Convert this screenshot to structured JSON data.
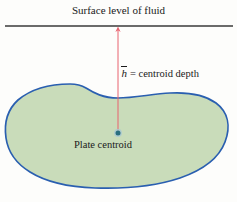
{
  "figure": {
    "name": "hydrostatic-plate-centroid-diagram",
    "background_color": "#fdfdfb",
    "surface_label": "Surface level of fluid",
    "depth_symbol": "h",
    "depth_equation": "= centroid depth",
    "centroid_label": "Plate centroid"
  },
  "colors": {
    "surface_line": "#3a3a3a",
    "arrow": "#e8626e",
    "plate_outline": "#2a5fb0",
    "plate_fill": "#c9dcba",
    "centroid_dot": "#2a6f7f",
    "text": "#1a1a1a"
  },
  "geometry": {
    "surface_line_y": 26,
    "surface_line_x1": 5,
    "surface_line_x2": 233,
    "arrow_x": 118,
    "arrow_top_y": 27,
    "arrow_bottom_y": 131,
    "centroid_x": 118,
    "centroid_y": 133,
    "centroid_radius": 3
  }
}
